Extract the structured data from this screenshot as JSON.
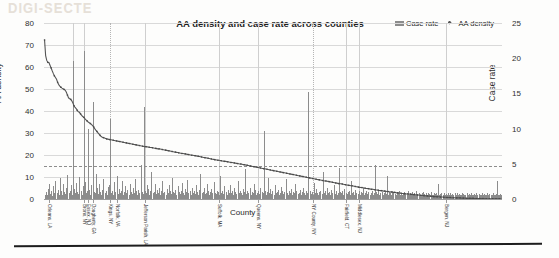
{
  "chart_data": {
    "type": "bar",
    "title": "AA density and case rate across counties",
    "xlabel": "County",
    "ylabel": "AA density",
    "y2label": "Case rate",
    "ylim": [
      0,
      80
    ],
    "y2lim": [
      0,
      25
    ],
    "yticks": [
      "0",
      "10",
      "20",
      "30",
      "40",
      "50",
      "60",
      "70",
      "80"
    ],
    "y2ticks": [
      "0",
      "5",
      "10",
      "15",
      "20",
      "25"
    ],
    "grid": true,
    "legend_position": "top-right",
    "legend": [
      {
        "name": "Case rate",
        "marker": "bar-swatch",
        "color": "#8c8c8c"
      },
      {
        "name": "AA density",
        "marker": "line-diamond",
        "color": "#555555"
      }
    ],
    "threshold_line": {
      "axis": "right",
      "value": 4.7,
      "style": "dashed"
    },
    "x_tick_labels": [
      {
        "index": 4,
        "label": "Orleans, LA"
      },
      {
        "index": 36,
        "label": "Bronx, NY"
      },
      {
        "index": 40,
        "label": "Essex, NJ"
      },
      {
        "index": 44,
        "label": "Dougherty, GA"
      },
      {
        "index": 60,
        "label": "Kings, NY"
      },
      {
        "index": 66,
        "label": "Norfolk, VA"
      },
      {
        "index": 92,
        "label": "Jefferson Parish, LA"
      },
      {
        "index": 160,
        "label": "Suffolk, MA"
      },
      {
        "index": 196,
        "label": "Queens, NY"
      },
      {
        "index": 246,
        "label": "NY County, NY"
      },
      {
        "index": 276,
        "label": "Fairfield, CT"
      },
      {
        "index": 288,
        "label": "Middlesex, NJ"
      },
      {
        "index": 368,
        "label": "Bergen, NJ"
      }
    ],
    "series": [
      {
        "name": "AA density",
        "axis": "left",
        "values": [
          72.3,
          65.2,
          63.0,
          62.1,
          62.0,
          60.8,
          59.6,
          58.3,
          57.1,
          56.0,
          55.2,
          54.4,
          53.0,
          52.0,
          51.3,
          50.8,
          50.4,
          50.1,
          49.8,
          49.4,
          48.5,
          47.2,
          46.0,
          45.6,
          45.3,
          44.6,
          43.6,
          42.4,
          41.6,
          41.1,
          40.3,
          39.6,
          39.4,
          38.7,
          38.0,
          37.5,
          37.1,
          36.5,
          36.0,
          35.5,
          35.0,
          34.7,
          34.3,
          33.9,
          33.4,
          32.8,
          32.0,
          31.3,
          30.7,
          30.1,
          29.5,
          28.9,
          28.4,
          28.1,
          27.9,
          27.7,
          27.5,
          27.3,
          27.2,
          27.1,
          27.0,
          26.9,
          26.8,
          26.7,
          26.6,
          26.5,
          26.4,
          26.3,
          26.2,
          26.1,
          26.0,
          25.9,
          25.8,
          25.7,
          25.6,
          25.5,
          25.4,
          25.3,
          25.2,
          25.1,
          25.0,
          24.9,
          24.8,
          24.7,
          24.6,
          24.5,
          24.4,
          24.3,
          24.2,
          24.1,
          24.0,
          23.9,
          23.8,
          23.8,
          23.7,
          23.6,
          23.5,
          23.4,
          23.4,
          23.3,
          23.2,
          23.1,
          23.0,
          22.9,
          22.8,
          22.8,
          22.7,
          22.6,
          22.5,
          22.4,
          22.3,
          22.2,
          22.1,
          22.0,
          21.9,
          21.8,
          21.7,
          21.6,
          21.5,
          21.4,
          21.3,
          21.2,
          21.1,
          21.0,
          20.9,
          20.8,
          20.7,
          20.7,
          20.6,
          20.5,
          20.4,
          20.3,
          20.2,
          20.1,
          20.0,
          19.9,
          19.9,
          19.8,
          19.7,
          19.6,
          19.5,
          19.4,
          19.3,
          19.2,
          19.1,
          19.0,
          18.9,
          18.8,
          18.7,
          18.6,
          18.5,
          18.4,
          18.3,
          18.2,
          18.1,
          18.0,
          17.9,
          17.8,
          17.7,
          17.6,
          17.6,
          17.5,
          17.4,
          17.3,
          17.2,
          17.1,
          17.1,
          17.0,
          16.9,
          16.8,
          16.7,
          16.6,
          16.6,
          16.5,
          16.4,
          16.3,
          16.2,
          16.1,
          16.0,
          15.9,
          15.9,
          15.8,
          15.7,
          15.6,
          15.5,
          15.4,
          15.3,
          15.2,
          15.1,
          15.0,
          14.9,
          14.8,
          14.7,
          14.6,
          14.5,
          14.4,
          14.3,
          14.2,
          14.1,
          14.0,
          13.9,
          13.8,
          13.7,
          13.6,
          13.5,
          13.4,
          13.3,
          13.2,
          13.1,
          13.0,
          12.9,
          12.8,
          12.7,
          12.6,
          12.5,
          12.4,
          12.3,
          12.2,
          12.1,
          12.0,
          11.9,
          11.8,
          11.7,
          11.6,
          11.5,
          11.4,
          11.3,
          11.2,
          11.1,
          11.0,
          10.9,
          10.8,
          10.7,
          10.6,
          10.5,
          10.4,
          10.3,
          10.2,
          10.1,
          10.0,
          9.9,
          9.8,
          9.7,
          9.6,
          9.5,
          9.4,
          9.3,
          9.2,
          9.1,
          9.0,
          8.9,
          8.8,
          8.7,
          8.6,
          8.5,
          8.4,
          8.3,
          8.2,
          8.2,
          8.1,
          8.0,
          7.9,
          7.8,
          7.7,
          7.6,
          7.5,
          7.4,
          7.3,
          7.2,
          7.1,
          7.0,
          6.9,
          6.9,
          6.8,
          6.7,
          6.6,
          6.5,
          6.4,
          6.3,
          6.2,
          6.1,
          6.0,
          6.0,
          5.9,
          5.8,
          5.7,
          5.6,
          5.5,
          5.4,
          5.3,
          5.2,
          5.2,
          5.1,
          5.0,
          4.9,
          4.8,
          4.8,
          4.7,
          4.6,
          4.5,
          4.4,
          4.4,
          4.3,
          4.2,
          4.1,
          4.1,
          4.0,
          3.9,
          3.8,
          3.8,
          3.7,
          3.6,
          3.6,
          3.5,
          3.4,
          3.4,
          3.3,
          3.2,
          3.2,
          3.1,
          3.0,
          3.0,
          2.9,
          2.8,
          2.8,
          2.7,
          2.7,
          2.6,
          2.5,
          2.5,
          2.4,
          2.4,
          2.3,
          2.3,
          2.2,
          2.2,
          2.1,
          2.1,
          2.0,
          2.0,
          1.9,
          1.9,
          1.8,
          1.8,
          1.7,
          1.7,
          1.6,
          1.6,
          1.5,
          1.5,
          1.4,
          1.4,
          1.3,
          1.3,
          1.3,
          1.2,
          1.2,
          1.1,
          1.1,
          1.1,
          1.0,
          1.0,
          1.0,
          0.9,
          0.9,
          0.9,
          0.8,
          0.8,
          0.8,
          0.7,
          0.7,
          0.7,
          0.7,
          0.6,
          0.6,
          0.6,
          0.6,
          0.5,
          0.5,
          0.5,
          0.5,
          0.5,
          0.4,
          0.4,
          0.4,
          0.4,
          0.4,
          0.3,
          0.3,
          0.3,
          0.3,
          0.3,
          0.3,
          0.3,
          0.2,
          0.2,
          0.2,
          0.2,
          0.2,
          0.2,
          0.2,
          0.2,
          0.2,
          0.2,
          0.1,
          0.1,
          0.1,
          0.1,
          0.1,
          0.1,
          0.1,
          0.1,
          0.1,
          0.1,
          0.1,
          0.1,
          0.1,
          0.1,
          0.1,
          0.1
        ]
      },
      {
        "name": "Case rate",
        "axis": "right",
        "values": [
          0.6,
          1.0,
          0.5,
          1.4,
          2.2,
          0.7,
          1.1,
          0.4,
          1.9,
          0.8,
          2.6,
          0.9,
          1.3,
          0.6,
          3.0,
          1.2,
          0.5,
          2.1,
          1.0,
          0.7,
          1.6,
          3.4,
          0.8,
          1.1,
          2.0,
          0.6,
          19.6,
          1.4,
          0.9,
          2.3,
          1.0,
          0.7,
          3.1,
          1.2,
          0.5,
          1.8,
          21.0,
          2.4,
          0.9,
          1.1,
          9.9,
          1.3,
          0.6,
          2.0,
          13.8,
          1.0,
          0.8,
          3.6,
          1.5,
          0.7,
          2.2,
          1.0,
          0.6,
          1.3,
          2.8,
          0.9,
          1.1,
          0.5,
          1.7,
          2.0,
          11.3,
          0.8,
          1.2,
          0.6,
          2.4,
          1.0,
          3.2,
          0.7,
          1.4,
          0.9,
          1.1,
          2.6,
          0.5,
          1.0,
          1.8,
          0.8,
          1.3,
          0.6,
          2.1,
          1.0,
          0.7,
          1.5,
          0.9,
          2.9,
          1.1,
          0.6,
          1.3,
          0.8,
          4.8,
          1.0,
          0.7,
          13.0,
          1.2,
          0.9,
          2.0,
          1.4,
          0.6,
          1.1,
          3.8,
          0.8,
          1.0,
          2.2,
          0.7,
          1.3,
          0.9,
          1.6,
          0.5,
          1.1,
          2.5,
          0.8,
          1.0,
          0.6,
          1.4,
          0.9,
          2.0,
          1.2,
          0.7,
          3.0,
          1.0,
          0.8,
          1.3,
          0.5,
          1.9,
          1.0,
          0.7,
          1.1,
          2.3,
          0.9,
          0.6,
          1.4,
          1.0,
          2.7,
          0.8,
          1.1,
          0.5,
          1.6,
          0.9,
          1.2,
          0.7,
          2.0,
          1.0,
          0.6,
          1.3,
          3.5,
          0.8,
          1.0,
          1.5,
          0.7,
          0.9,
          2.1,
          1.1,
          0.6,
          1.0,
          1.4,
          0.8,
          2.4,
          0.9,
          0.7,
          1.2,
          1.0,
          0.5,
          3.3,
          0.9,
          1.1,
          0.7,
          1.8,
          1.0,
          0.6,
          1.3,
          0.8,
          2.0,
          0.9,
          1.1,
          0.6,
          1.5,
          1.0,
          0.7,
          2.6,
          0.9,
          1.2,
          0.8,
          0.6,
          1.4,
          1.0,
          4.2,
          0.7,
          1.1,
          0.9,
          1.6,
          0.5,
          1.0,
          0.8,
          2.2,
          1.3,
          0.6,
          0.9,
          1.1,
          0.7,
          1.5,
          1.0,
          0.8,
          9.6,
          1.2,
          0.6,
          1.0,
          3.0,
          0.9,
          1.4,
          0.7,
          1.1,
          0.5,
          2.0,
          0.8,
          1.0,
          1.3,
          0.6,
          0.9,
          1.7,
          1.1,
          0.7,
          1.0,
          2.8,
          0.8,
          0.5,
          1.2,
          0.9,
          1.4,
          0.6,
          1.0,
          0.8,
          2.1,
          1.1,
          0.7,
          0.9,
          1.3,
          0.5,
          1.0,
          1.6,
          0.8,
          0.6,
          1.1,
          0.9,
          15.2,
          1.2,
          0.7,
          1.0,
          0.5,
          2.3,
          0.8,
          1.4,
          0.9,
          0.6,
          1.0,
          1.2,
          0.7,
          3.9,
          0.9,
          1.1,
          0.5,
          1.5,
          0.8,
          1.0,
          0.6,
          1.3,
          0.9,
          2.0,
          0.7,
          1.1,
          0.5,
          0.9,
          4.4,
          1.0,
          0.8,
          1.2,
          0.6,
          1.4,
          0.9,
          0.7,
          1.0,
          1.1,
          0.5,
          2.6,
          0.8,
          1.0,
          0.6,
          1.3,
          0.9,
          0.7,
          1.1,
          0.5,
          1.0,
          0.8,
          1.5,
          0.6,
          0.9,
          1.2,
          0.7,
          1.0,
          0.5,
          0.8,
          1.1,
          0.6,
          0.9,
          4.9,
          1.0,
          0.7,
          1.3,
          0.5,
          0.8,
          1.0,
          0.6,
          0.9,
          1.1,
          0.7,
          3.2,
          0.5,
          1.0,
          0.8,
          0.6,
          1.2,
          0.9,
          0.7,
          0.5,
          1.0,
          0.8,
          1.1,
          0.6,
          0.9,
          0.5,
          0.7,
          1.0,
          0.8,
          0.6,
          1.2,
          0.5,
          0.9,
          0.7,
          1.0,
          0.6,
          0.8,
          0.5,
          1.1,
          0.7,
          0.9,
          0.6,
          0.5,
          0.8,
          1.0,
          0.7,
          0.6,
          0.9,
          0.5,
          0.8,
          0.7,
          1.0,
          0.6,
          0.5,
          0.9,
          0.7,
          0.8,
          0.6,
          2.2,
          0.5,
          0.7,
          0.9,
          0.6,
          0.8,
          0.5,
          0.7,
          0.6,
          0.9,
          0.5,
          0.8,
          0.6,
          0.7,
          0.5,
          0.9,
          0.6,
          0.8,
          0.5,
          0.7,
          0.6,
          0.5,
          0.8,
          0.7,
          0.6,
          0.5,
          0.9,
          0.6,
          0.7,
          0.5,
          0.8,
          0.6,
          0.5,
          0.7,
          0.6,
          0.9,
          0.5,
          0.7,
          0.6,
          0.5,
          0.8,
          0.6,
          0.7,
          0.5,
          0.6,
          0.9,
          0.5,
          0.7,
          0.6,
          0.5,
          0.8,
          0.6,
          0.5,
          0.7,
          2.6,
          0.6,
          0.5,
          0.7,
          0.6
        ]
      }
    ],
    "vertical_rules": [
      {
        "index": 26,
        "style": "solid"
      },
      {
        "index": 36,
        "style": "solid"
      },
      {
        "index": 60,
        "style": "dotted"
      },
      {
        "index": 92,
        "style": "solid"
      },
      {
        "index": 160,
        "style": "solid"
      },
      {
        "index": 196,
        "style": "solid"
      },
      {
        "index": 246,
        "style": "dotted"
      },
      {
        "index": 276,
        "style": "solid"
      },
      {
        "index": 288,
        "style": "solid"
      },
      {
        "index": 368,
        "style": "solid"
      }
    ]
  },
  "artifacts": {
    "bleed_text": "DIGI-SECTE"
  }
}
